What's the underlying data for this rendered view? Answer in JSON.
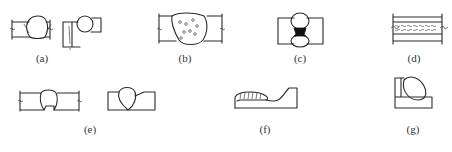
{
  "figure": {
    "panels": [
      {
        "id": "a",
        "label": "(a)",
        "x": 42,
        "y": 60
      },
      {
        "id": "b",
        "label": "(b)",
        "x": 185,
        "y": 60
      },
      {
        "id": "c",
        "label": "(c)",
        "x": 300,
        "y": 60
      },
      {
        "id": "d",
        "label": "(d)",
        "x": 414,
        "y": 60
      },
      {
        "id": "e",
        "label": "(e)",
        "x": 90,
        "y": 124
      },
      {
        "id": "f",
        "label": "(f)",
        "x": 265,
        "y": 124
      },
      {
        "id": "g",
        "label": "(g)",
        "x": 413,
        "y": 124
      }
    ]
  }
}
